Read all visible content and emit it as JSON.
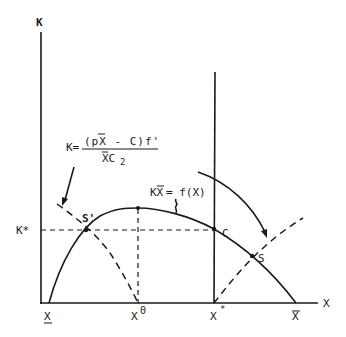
{
  "diagram": {
    "axes": {
      "y_label": "K",
      "x_label": "X"
    },
    "x_ticks": [
      {
        "id": "x-lower",
        "label": "X",
        "decoration": "underline"
      },
      {
        "id": "x-zero",
        "label": "X",
        "superscript": "0"
      },
      {
        "id": "x-star",
        "label": "X",
        "superscript": "*"
      },
      {
        "id": "x-bar",
        "label": "X",
        "decoration": "overline"
      }
    ],
    "y_ticks": [
      {
        "id": "k-star",
        "label": "K*"
      }
    ],
    "points": [
      {
        "id": "s-prime",
        "label": "S'"
      },
      {
        "id": "c",
        "label": "C"
      },
      {
        "id": "s",
        "label": "S"
      }
    ],
    "equations": {
      "growth_curve": {
        "lhs_text": "KX",
        "lhs_overline_char": "X",
        "rhs_text": "= f(X)"
      },
      "dashed_curve": {
        "lhs": "K=",
        "numerator": "(pX - C)f'",
        "denominator": "XC",
        "denominator_subscript": "2"
      }
    },
    "curves": [
      {
        "id": "growth-curve",
        "style": "solid",
        "description": "K X̄ = f(X)"
      },
      {
        "id": "optimal-curve-left",
        "style": "dashed"
      },
      {
        "id": "optimal-curve-right",
        "style": "dashed"
      },
      {
        "id": "x-star-line",
        "style": "solid"
      },
      {
        "id": "k-star-line",
        "style": "dashed"
      },
      {
        "id": "x-zero-line",
        "style": "dashed"
      }
    ]
  }
}
